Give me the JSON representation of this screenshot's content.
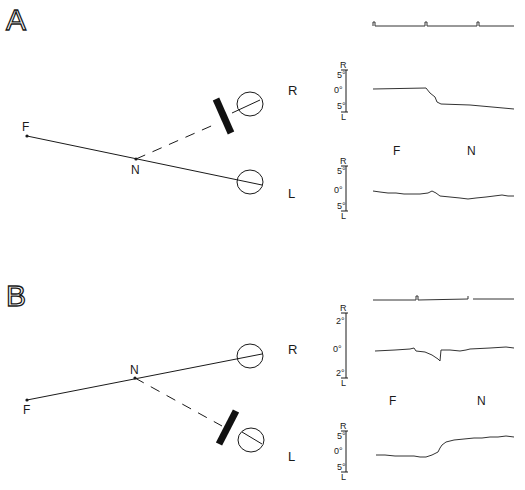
{
  "panels": [
    {
      "letter": "A",
      "points": {
        "far": "F",
        "near": "N"
      },
      "eyes": {
        "right": "R",
        "left": "L"
      },
      "occluded_eye": "right",
      "phase_labels": {
        "far": "F",
        "near": "N"
      },
      "right_scale": {
        "top": "R",
        "upper": "5°",
        "zero": "0°",
        "lower": "5°",
        "bottom": "L"
      },
      "left_scale": {
        "top": "R",
        "upper": "5°",
        "zero": "0°",
        "lower": "5°",
        "bottom": "L"
      }
    },
    {
      "letter": "B",
      "points": {
        "far": "F",
        "near": "N"
      },
      "eyes": {
        "right": "R",
        "left": "L"
      },
      "occluded_eye": "left",
      "phase_labels": {
        "far": "F",
        "near": "N"
      },
      "right_scale": {
        "top": "R",
        "upper": "2°",
        "zero": "0°",
        "lower": "2°",
        "bottom": "L"
      },
      "left_scale": {
        "top": "R",
        "upper": "5°",
        "zero": "0°",
        "lower": "5°",
        "bottom": "L"
      }
    }
  ]
}
